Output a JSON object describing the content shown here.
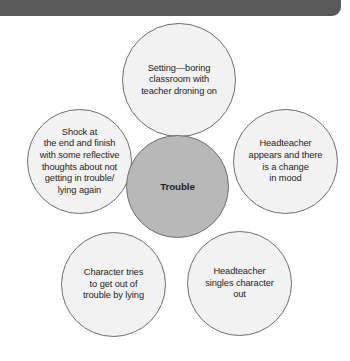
{
  "header": {
    "accent_color": "#595959"
  },
  "diagram": {
    "type": "radial-bubble-map",
    "center": {
      "id": "trouble",
      "label": "Trouble",
      "fill_color": "#b8b8b8",
      "stroke_color": "#6e6e6e"
    },
    "node_fill_color": "#f2f2f2",
    "node_stroke_color": "#6e6e6e",
    "text_color": "#231f20",
    "nodes": [
      {
        "id": "setting",
        "position": "top",
        "label": "Setting—boring\nclassroom with\nteacher droning on"
      },
      {
        "id": "headteacher-appears",
        "position": "right",
        "label": "Headteacher\nappears and there\nis a change\nin mood"
      },
      {
        "id": "headteacher-singles-out",
        "position": "bottom-right",
        "label": "Headteacher\nsingles character\nout"
      },
      {
        "id": "character-lies",
        "position": "bottom-left",
        "label": "Character tries\nto get out of\ntrouble by lying"
      },
      {
        "id": "shock-reflection",
        "position": "left",
        "label": "Shock at\nthe end and finish\nwith some reflective\nthoughts about not\ngetting in trouble/\nlying again"
      }
    ]
  }
}
